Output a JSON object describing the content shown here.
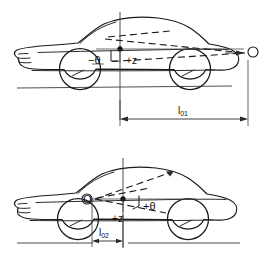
{
  "figure": {
    "background_color": "#ffffff",
    "line_color": "#1a1a1a"
  },
  "panels": [
    {
      "id": "upper",
      "name": "upper-diagram",
      "pitch_center_label": "O",
      "pitch_center_side": "right-outside-vehicle",
      "angle_label": "−θ",
      "displacement_label": "+z",
      "dimension_label_main": "l",
      "dimension_label_sub": "01",
      "dimension_label_full": "l01"
    },
    {
      "id": "lower",
      "name": "lower-diagram",
      "pitch_center_label": "O",
      "pitch_center_side": "left-inside-vehicle",
      "angle_label": "+θ",
      "displacement_label": "+z",
      "dimension_label_main": "l",
      "dimension_label_sub": "02",
      "dimension_label_full": "l02"
    }
  ],
  "symbols": {
    "theta_negative": "−θ",
    "theta_positive": "+θ",
    "z_positive": "+z",
    "origin": "O"
  }
}
